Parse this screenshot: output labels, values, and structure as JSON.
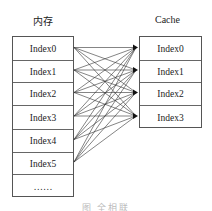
{
  "memory": {
    "title": "内存",
    "rows": [
      "Index0",
      "Index1",
      "Index2",
      "Index3",
      "Index4",
      "Index5",
      "……"
    ]
  },
  "cache": {
    "title": "Cache",
    "rows": [
      "Index0",
      "Index1",
      "Index2",
      "Index3"
    ]
  },
  "mapping": "fully-associative: every memory block Index0–Index5 connects to every cache line Index0–Index3",
  "caption": "图    全相联"
}
